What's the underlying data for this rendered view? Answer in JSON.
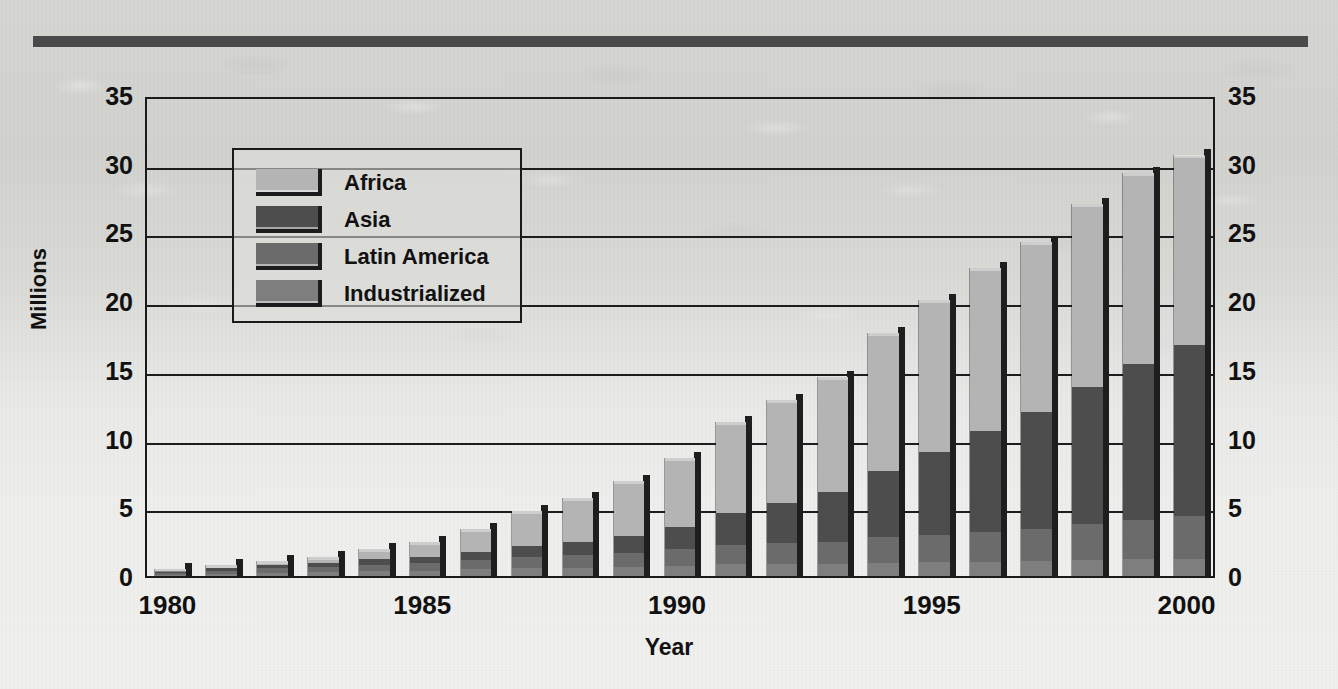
{
  "chart_data": {
    "type": "bar",
    "stacked": true,
    "title": "",
    "xlabel": "Year",
    "ylabel": "Millions",
    "ylim": [
      0,
      35
    ],
    "ytick_step": 5,
    "yticks": [
      "0",
      "5",
      "10",
      "15",
      "20",
      "25",
      "30",
      "35"
    ],
    "grid": true,
    "grid_axis": "y",
    "dual_y_axis": true,
    "legend_position": "upper-left-inside",
    "categories": [
      "1980",
      "1981",
      "1982",
      "1983",
      "1984",
      "1985",
      "1986",
      "1987",
      "1988",
      "1989",
      "1990",
      "1991",
      "1992",
      "1993",
      "1994",
      "1995",
      "1996",
      "1997",
      "1998",
      "1999",
      "2000"
    ],
    "xtick_labels": [
      "1980",
      "1985",
      "1990",
      "1995",
      "2000"
    ],
    "xtick_categories": [
      "1980",
      "1985",
      "1990",
      "1995",
      "2000"
    ],
    "series": [
      {
        "name": "Industrialized",
        "color": "#7e7e7e",
        "values": [
          0.1,
          0.15,
          0.2,
          0.3,
          0.4,
          0.5,
          0.6,
          0.7,
          0.8,
          0.9,
          1.0,
          1.05,
          1.1,
          1.2,
          1.25,
          1.3,
          1.35,
          1.4,
          1.45,
          1.5,
          1.6
        ]
      },
      {
        "name": "Latin America",
        "color": "#6b6b6b",
        "values": [
          0.15,
          0.25,
          0.35,
          0.45,
          0.6,
          0.7,
          0.85,
          1.0,
          1.2,
          1.4,
          1.6,
          1.8,
          2.0,
          2.2,
          2.4,
          2.6,
          2.8,
          3.0,
          3.3,
          3.6,
          4.0
        ]
      },
      {
        "name": "Asia",
        "color": "#4d4d4d",
        "values": [
          0.15,
          0.2,
          0.25,
          0.35,
          0.5,
          0.6,
          0.75,
          1.0,
          1.3,
          1.7,
          2.2,
          2.9,
          3.8,
          5.0,
          6.3,
          7.8,
          9.4,
          11.0,
          12.6,
          14.1,
          15.9
        ]
      },
      {
        "name": "Africa",
        "color": "#b4b4b4",
        "values": [
          0.1,
          0.2,
          0.3,
          0.5,
          0.9,
          1.4,
          2.1,
          3.1,
          4.2,
          5.4,
          6.7,
          8.2,
          9.8,
          11.6,
          13.0,
          14.3,
          15.3,
          16.0,
          16.8,
          17.3,
          17.6
        ]
      }
    ],
    "totals": [
      0.5,
      0.8,
      1.1,
      1.6,
      2.4,
      3.2,
      4.3,
      5.8,
      7.5,
      9.4,
      11.5,
      13.95,
      16.7,
      20.0,
      22.95,
      26.0,
      28.85,
      31.4,
      34.15,
      36.5,
      39.1
    ],
    "bar_totals_visible": [
      0.5,
      0.8,
      1.1,
      1.4,
      2.0,
      2.5,
      3.4,
      4.7,
      5.7,
      6.9,
      8.6,
      11.2,
      12.8,
      14.5,
      17.7,
      20.1,
      22.4,
      24.3,
      27.1,
      29.3,
      30.6
    ]
  },
  "legend": {
    "items": [
      {
        "label": "Africa",
        "color": "#b4b4b4"
      },
      {
        "label": "Asia",
        "color": "#4d4d4d"
      },
      {
        "label": "Latin America",
        "color": "#6b6b6b"
      },
      {
        "label": "Industrialized",
        "color": "#7e7e7e"
      }
    ]
  },
  "axes": {
    "y_title": "Millions",
    "x_title": "Year",
    "y_ticks": [
      "35",
      "30",
      "25",
      "20",
      "15",
      "10",
      "5",
      "0"
    ],
    "x_ticks": [
      "1980",
      "1985",
      "1990",
      "1995",
      "2000"
    ]
  }
}
